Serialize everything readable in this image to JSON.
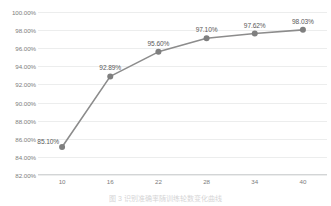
{
  "chart_data": {
    "type": "line",
    "title": "",
    "subtitle": "",
    "xlabel": "",
    "ylabel": "",
    "x": [
      10,
      16,
      22,
      28,
      34,
      40
    ],
    "categories": [
      "10",
      "16",
      "22",
      "28",
      "34",
      "40"
    ],
    "values": [
      85.1,
      92.89,
      95.6,
      97.1,
      97.62,
      98.03
    ],
    "data_labels": [
      "85.10%",
      "92.89%",
      "95.60%",
      "97.10%",
      "97.62%",
      "98.03%"
    ],
    "series": [
      {
        "name": "",
        "values": [
          85.1,
          92.89,
          95.6,
          97.1,
          97.62,
          98.03
        ]
      }
    ],
    "ylim": [
      82.0,
      100.0
    ],
    "xlim": [
      7,
      43
    ],
    "ytick_labels": [
      "100.00%",
      "98.00%",
      "96.00%",
      "94.00%",
      "92.00%",
      "90.00%",
      "88.00%",
      "86.00%",
      "84.00%",
      "82.00%"
    ],
    "ytick_values": [
      100,
      98,
      96,
      94,
      92,
      90,
      88,
      86,
      84,
      82
    ],
    "xtick_labels": [
      "10",
      "16",
      "22",
      "28",
      "34",
      "40"
    ],
    "grid": "horizontal",
    "legend": "none",
    "line_color": "#8c8c8c",
    "marker_color": "#7f7f7f",
    "gridline_color": "#eceded",
    "axis_color": "#d3d5d6",
    "tick_label_color": "#7d7d7d",
    "data_label_color": "#5a5a5a",
    "background_color": "#ffffff"
  },
  "caption": {
    "text": "图 3 识别准确率随训练轮数变化曲线"
  }
}
